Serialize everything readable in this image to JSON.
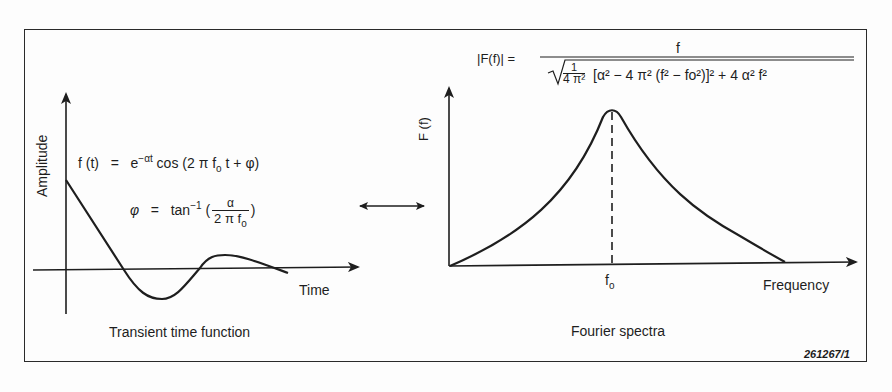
{
  "figure_id": "261267/1",
  "left_panel": {
    "y_axis_label": "Amplitude",
    "x_axis_label": "Time",
    "caption": "Transient time function",
    "equation_ft": {
      "lhs": "f (t)",
      "eq": "=",
      "exp_base": "e",
      "exp_power": "−αt",
      "rest": " cos (2 π f",
      "sub": "o",
      "tail": " t + φ)"
    },
    "equation_phi": {
      "lhs": "φ",
      "eq": "=",
      "fn": "tan",
      "fn_power": "−1",
      "open": "(",
      "num": "α",
      "den": "2 π f",
      "den_sub": "o",
      "close": ")"
    }
  },
  "right_panel": {
    "y_axis_label": "F (f)",
    "x_axis_label": "Frequency",
    "peak_label": "f",
    "peak_label_sub": "o",
    "caption": "Fourier spectra",
    "equation_Ff": {
      "lhs": "|F(f)| =",
      "numerator": "f",
      "denominator_text": "[α² − 4 π² (f² − fo²)]² + 4 α² f²",
      "inner_frac_num": "1",
      "inner_frac_den": "4 π²"
    }
  },
  "relation_arrow": "double-headed-arrow",
  "colors": {
    "ink": "#1e1e1e",
    "background": "#fdfdfd"
  }
}
